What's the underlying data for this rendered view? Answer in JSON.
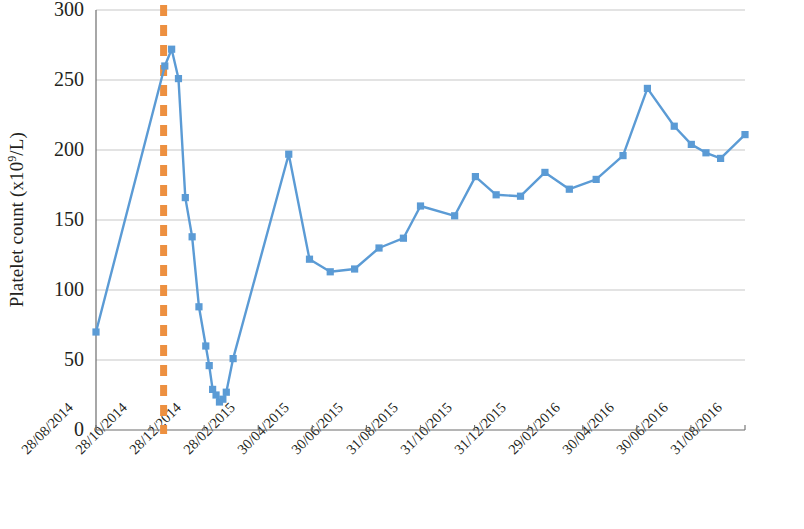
{
  "chart_data": {
    "type": "line",
    "title": "",
    "xlabel": "",
    "ylabel": "Platelet count (x10⁹/L)",
    "ylabel_prefix": "Platelet count (x10",
    "ylabel_sup": "9",
    "ylabel_suffix": "/L)",
    "ylim": [
      0,
      300
    ],
    "ytick_labels": [
      "300",
      "250",
      "200",
      "150",
      "100",
      "50",
      "0"
    ],
    "ytick_values": [
      300,
      250,
      200,
      150,
      100,
      50,
      0
    ],
    "xtick_labels": [
      "28/08/2014",
      "28/10/2014",
      "28/12/2014",
      "28/02/2015",
      "30/04/2015",
      "30/06/2015",
      "31/08/2015",
      "31/10/2015",
      "31/12/2015",
      "29/02/2016",
      "30/04/2016",
      "30/06/2016",
      "31/08/2016"
    ],
    "xlim_start": "28/08/2014",
    "xlim_end": "31/08/2016",
    "grid": "horizontal",
    "legend": "none",
    "series": [
      {
        "name": "Platelet count",
        "color": "#5b9bd5",
        "marker": "square",
        "x": [
          0.0,
          2.82,
          3.1,
          3.38,
          3.66,
          3.94,
          4.22,
          4.5,
          4.64,
          4.78,
          4.92,
          5.06,
          5.2,
          5.34,
          5.62,
          7.9,
          8.75,
          9.6,
          10.6,
          11.6,
          12.6,
          13.3,
          14.7,
          15.55,
          16.4,
          17.4,
          18.4,
          19.4,
          20.5,
          21.6,
          22.6,
          23.7,
          24.4
        ],
        "values": [
          70,
          260,
          272,
          251,
          166,
          138,
          88,
          60,
          46,
          29,
          25,
          20,
          22,
          27,
          51,
          197,
          122,
          113,
          115,
          130,
          137,
          160,
          153,
          181,
          168,
          167,
          184,
          172,
          179,
          196,
          244,
          217,
          204
        ]
      }
    ],
    "series_tail": {
      "x": [
        25.0,
        25.6,
        26.6
      ],
      "values": [
        198,
        194,
        211
      ]
    },
    "vertical_marker": {
      "label": "treatment-start-marker",
      "color": "#ed9040",
      "style": "dashed",
      "x_index": 1.25
    }
  }
}
